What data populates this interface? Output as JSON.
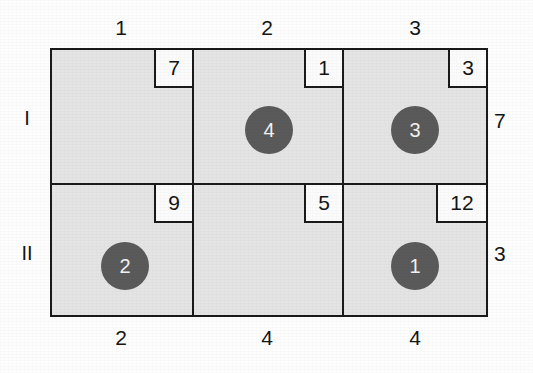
{
  "diagram": {
    "type": "transportation-tableau",
    "rows": 2,
    "columns": 3,
    "column_headers": [
      "1",
      "2",
      "3"
    ],
    "row_headers": [
      "I",
      "II"
    ],
    "row_supplies": [
      "7",
      "3"
    ],
    "column_demands": [
      "2",
      "4",
      "4"
    ],
    "cells": [
      {
        "row": "I",
        "column": "1",
        "cost": "7",
        "allocation": null
      },
      {
        "row": "I",
        "column": "2",
        "cost": "1",
        "allocation": "4"
      },
      {
        "row": "I",
        "column": "3",
        "cost": "3",
        "allocation": "3"
      },
      {
        "row": "II",
        "column": "1",
        "cost": "9",
        "allocation": "2"
      },
      {
        "row": "II",
        "column": "2",
        "cost": "5",
        "allocation": null
      },
      {
        "row": "II",
        "column": "3",
        "cost": "12",
        "allocation": "1"
      }
    ],
    "colors": {
      "cell_fill": "#e4e4e4",
      "grid_line": "#1a1a1a",
      "cost_box_fill": "#fbfbfb",
      "allocation_circle": "#5a5a5a",
      "allocation_text": "#f2f2f2",
      "page_background": "#fdfdfd"
    }
  }
}
